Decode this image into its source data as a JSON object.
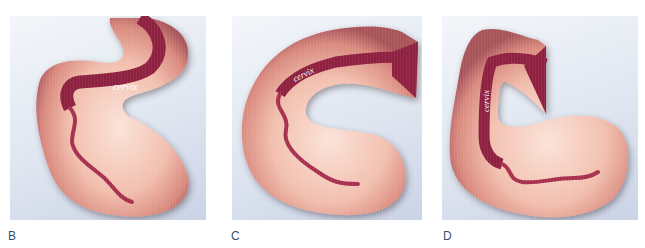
{
  "figure": {
    "panels": [
      {
        "id": "B",
        "label": "B",
        "annotation": "cervix",
        "orientation": "anteverted-anteflexed"
      },
      {
        "id": "C",
        "label": "C",
        "annotation": "cervix",
        "orientation": "retroverted"
      },
      {
        "id": "D",
        "label": "D",
        "annotation": "cervix",
        "orientation": "retroverted-retroflexed"
      }
    ],
    "colors": {
      "background_light": "#f3f6fa",
      "background_dark": "#c9d3e6",
      "tissue_light": "#f6cfc1",
      "tissue_mid": "#e9a594",
      "tissue_shadow": "#a8545a",
      "canal": "#8e2040",
      "canal_highlight": "#b8375e",
      "label_text": "#35506e"
    }
  }
}
